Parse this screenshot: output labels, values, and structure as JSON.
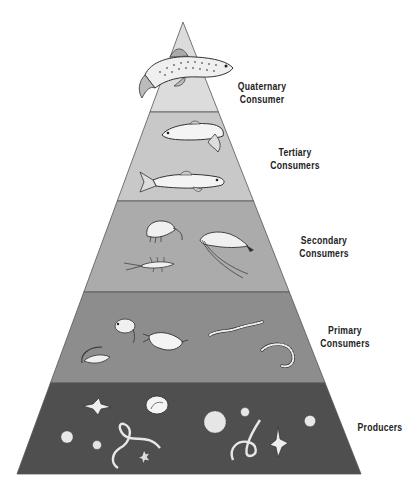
{
  "diagram": {
    "type": "food-pyramid",
    "tiers": [
      {
        "id": "quaternary",
        "label_line1": "Quaternary",
        "label_line2": "Consumer",
        "fill": "#dcdcdc",
        "organisms": [
          "trout"
        ]
      },
      {
        "id": "tertiary",
        "label_line1": "Tertiary",
        "label_line2": "Consumers",
        "fill": "#c8c8c8",
        "organisms": [
          "fish",
          "fish"
        ]
      },
      {
        "id": "secondary",
        "label_line1": "Secondary",
        "label_line2": "Consumers",
        "fill": "#ababab",
        "organisms": [
          "amphipod",
          "shrimp",
          "larva"
        ]
      },
      {
        "id": "primary",
        "label_line1": "Primary",
        "label_line2": "Consumers",
        "fill": "#8d8d8d",
        "organisms": [
          "water-flea",
          "copepod",
          "snail",
          "worm",
          "curled-worm"
        ]
      },
      {
        "id": "producers",
        "label_line1": "Producers",
        "label_line2": "",
        "fill": "#4f4f4f",
        "organisms": [
          "diatom",
          "algae",
          "filament",
          "colony",
          "dinoflagellate"
        ]
      }
    ],
    "colors": {
      "outline": "#555555",
      "label": "#222222",
      "organism_fill": "#f4f4f4",
      "organism_stroke": "#333333"
    }
  }
}
